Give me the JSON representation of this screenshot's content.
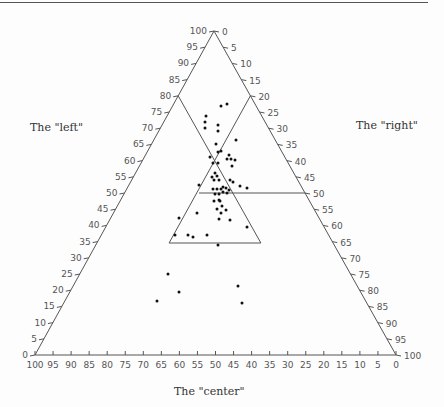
{
  "chart_data": {
    "type": "scatter",
    "subtype": "ternary",
    "title": "",
    "axes": {
      "left": {
        "label": "The \"left\"",
        "ticks": [
          0,
          5,
          10,
          15,
          20,
          25,
          30,
          35,
          40,
          45,
          50,
          55,
          60,
          65,
          70,
          75,
          80,
          85,
          90,
          95,
          100
        ]
      },
      "right": {
        "label": "The \"right\"",
        "ticks": [
          0,
          5,
          10,
          15,
          20,
          25,
          30,
          35,
          40,
          45,
          50,
          55,
          60,
          65,
          70,
          75,
          80,
          85,
          90,
          95,
          100
        ]
      },
      "bottom": {
        "label": "The \"center\"",
        "ticks": [
          100,
          95,
          90,
          85,
          80,
          75,
          70,
          65,
          60,
          55,
          50,
          45,
          40,
          35,
          30,
          25,
          20,
          15,
          10,
          5,
          0
        ]
      }
    },
    "reference_lines": [
      {
        "desc": "line from left=80 parallel to right edge"
      },
      {
        "desc": "line from right=20 parallel to left edge"
      },
      {
        "desc": "horizontal line at right=50"
      },
      {
        "desc": "inner triangle with base at left=35"
      }
    ],
    "points_px": [
      [
        221,
        106
      ],
      [
        227,
        104
      ],
      [
        206,
        116
      ],
      [
        205,
        122
      ],
      [
        205,
        128
      ],
      [
        218,
        125
      ],
      [
        218,
        131
      ],
      [
        236,
        140
      ],
      [
        216,
        144
      ],
      [
        218,
        152
      ],
      [
        221,
        151
      ],
      [
        210,
        157
      ],
      [
        213,
        163
      ],
      [
        218,
        163
      ],
      [
        229,
        155
      ],
      [
        227,
        159
      ],
      [
        231,
        159
      ],
      [
        235,
        160
      ],
      [
        232,
        166
      ],
      [
        215,
        173
      ],
      [
        217,
        176
      ],
      [
        212,
        177
      ],
      [
        219,
        180
      ],
      [
        214,
        180
      ],
      [
        199,
        185
      ],
      [
        230,
        180
      ],
      [
        233,
        182
      ],
      [
        240,
        186
      ],
      [
        247,
        188
      ],
      [
        213,
        189
      ],
      [
        217,
        189
      ],
      [
        221,
        189
      ],
      [
        223,
        187
      ],
      [
        226,
        188
      ],
      [
        229,
        190
      ],
      [
        223,
        192
      ],
      [
        227,
        193
      ],
      [
        215,
        194
      ],
      [
        219,
        194
      ],
      [
        214,
        201
      ],
      [
        219,
        200
      ],
      [
        220,
        201
      ],
      [
        222,
        206
      ],
      [
        217,
        209
      ],
      [
        226,
        210
      ],
      [
        221,
        213
      ],
      [
        219,
        219
      ],
      [
        230,
        220
      ],
      [
        197,
        213
      ],
      [
        179,
        218
      ],
      [
        247,
        227
      ],
      [
        175,
        235
      ],
      [
        188,
        235
      ],
      [
        193,
        237
      ],
      [
        207,
        235
      ],
      [
        218,
        245
      ],
      [
        168,
        274
      ],
      [
        179,
        292
      ],
      [
        157,
        301
      ],
      [
        238,
        286
      ],
      [
        242,
        303
      ]
    ],
    "grid": false,
    "legend": null
  },
  "labels": {
    "left": "The \"left\"",
    "right": "The \"right\"",
    "center": "The \"center\""
  }
}
